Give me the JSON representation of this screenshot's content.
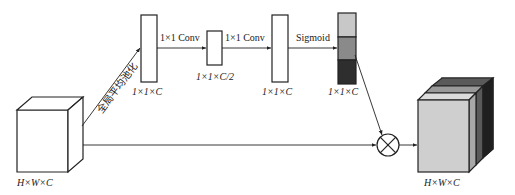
{
  "diagram": {
    "type": "channel-attention-block",
    "input": {
      "label": "H×W×C"
    },
    "gap_label": "全局平均池化",
    "nodes": [
      {
        "id": "gap",
        "label": "1×1×C"
      },
      {
        "id": "conv1",
        "label": "1×1×C/2"
      },
      {
        "id": "conv2",
        "label": "1×1×C"
      },
      {
        "id": "sigmoid",
        "label": "1×1×C"
      }
    ],
    "edges": [
      {
        "from": "input",
        "to": "gap",
        "label": "全局平均池化"
      },
      {
        "from": "gap",
        "to": "conv1",
        "label": "1×1 Conv"
      },
      {
        "from": "conv1",
        "to": "conv2",
        "label": "1×1 Conv"
      },
      {
        "from": "conv2",
        "to": "sigmoid",
        "label": "Sigmoid"
      },
      {
        "from": "sigmoid",
        "to": "multiply",
        "label": ""
      },
      {
        "from": "input",
        "to": "multiply",
        "label": ""
      },
      {
        "from": "multiply",
        "to": "output",
        "label": ""
      }
    ],
    "multiply_symbol": "⊗",
    "output": {
      "label": "H×W×C"
    },
    "edge_labels": {
      "conv1": "1×1 Conv",
      "conv2": "1×1 Conv",
      "sigmoid": "Sigmoid"
    },
    "colors": {
      "weight_light": "#c8c8c8",
      "weight_mid": "#8a8a8a",
      "weight_dark": "#2e2e2e",
      "stroke": "#222222"
    }
  }
}
